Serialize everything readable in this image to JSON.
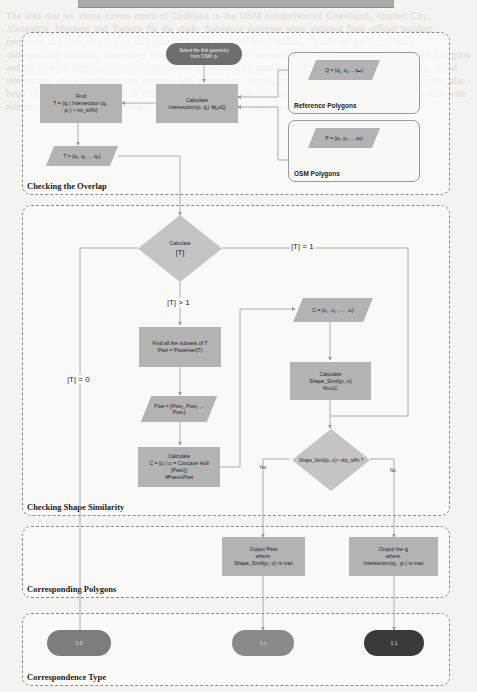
{
  "background_text": "The area that we chose covers much of Ludhiana in the OSM comparison of Chandigarh, Quebec City, Alexandria, Montreal and Toronto for the study. Reference polygons were obtained from official building footprints and their changes to find matching objects in the other dataset. Details of the figure with corresponding matching processing from an Object-Oriented Intersection Operation process used in OSM polygons and reference polygons. The proposed method performs with comparison of two different datasets using spatial intersection, shape similarity and concave hull approaches. Topological similarity between building footprints also helps to match 1:1, 1:n and n:m relationships across datasets. For each OSM polygon, the intersection ratio with reference polygons is computed and candidate polygons are selected above a tolerance threshold.",
  "title_bar": "",
  "sections": {
    "overlap": {
      "label": "Checking the Overlap"
    },
    "shape": {
      "label": "Checking Shape Similarity"
    },
    "corresponding": {
      "label": "Corresponding Polygons"
    },
    "type": {
      "label": "Correspondence Type"
    }
  },
  "nodes": {
    "start": {
      "line1": "Select the first geometry",
      "line2": "from OSM: pᵢ"
    },
    "calc_intersection": {
      "line1": "Calculate",
      "line2": "Intersection(pᵢ, qⱼ)  ∀qⱼ∈Q"
    },
    "find_t": {
      "line1": "Find",
      "line2": "T = {qⱼ | Intersection (qⱼ ,",
      "line3": "pᵢ ) > int_tol%}"
    },
    "t_set": {
      "text": "T = {q₁, q₂ , .. qₖ}"
    },
    "q_set": {
      "text": "Q = {q₁, q₂, .. qₘ}"
    },
    "p_set": {
      "text": "P = {p₁, p₂ , .. pₙ}"
    },
    "calc_t": {
      "line1": "Calculate",
      "line2": "|T|"
    },
    "find_subsets": {
      "line1": "Find all the subsets of T",
      "line2": "Pset = Powerset(T)"
    },
    "pset": {
      "line1": "Pset = {Pset₁, Pset₂ ,..",
      "line2": "Psetₗ}"
    },
    "calc_concave": {
      "line1": "Calculate",
      "line2": "C = {cᵢ | cᵢ = Concave Hull",
      "line3": "(Psetᵢ)}",
      "line4": "∀Psetᵢ∈Pset"
    },
    "c_set": {
      "text": "C = {c₁ , c₂ , ... , cₗ}"
    },
    "calc_shape": {
      "line1": "Calculate",
      "line2": "Shape_Simil(pᵢ, cᵢ)",
      "line3": "∀cᵢ∈C"
    },
    "shape_decision": {
      "text": "Shape_Simil(pᵢ, cᵢ)> shp_tol% ?"
    },
    "output_pset": {
      "line1": "Output Psetᵢ",
      "line2": "where:",
      "line3": "Shape_Simil(pᵢ, cᵢ) is max"
    },
    "output_q": {
      "line1": "Output the qⱼ",
      "line2": "where:",
      "line3": "Intersection(qⱼ , pᵢ ) is max"
    },
    "type_10": {
      "text": "1:0"
    },
    "type_1n": {
      "text": "1:n"
    },
    "type_11": {
      "text": "1:1"
    }
  },
  "groups": {
    "reference": {
      "label": "Reference Polygons"
    },
    "osm": {
      "label": "OSM Polygons"
    }
  },
  "edge_labels": {
    "t_eq_1": "|T| = 1",
    "t_gt_1": "|T| > 1",
    "t_eq_0": "|T| = 0",
    "yes": "Yes",
    "no": "No"
  },
  "colors": {
    "box_fill": "#b3b3b3",
    "start_fill": "#6e6e6e",
    "type_10": "#7d7d7d",
    "type_1n": "#8a8a8a",
    "type_11": "#3a3a3a",
    "line": "#9a9a9a"
  }
}
